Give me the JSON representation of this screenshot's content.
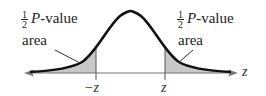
{
  "diagram": {
    "type": "normal-distribution-two-tailed",
    "left_label": {
      "fraction_num": "1",
      "fraction_den": "2",
      "var": "P",
      "text": "-value",
      "line2": "area"
    },
    "right_label": {
      "fraction_num": "1",
      "fraction_den": "2",
      "var": "P",
      "text": "-value",
      "line2": "area"
    },
    "axis_label": "z",
    "tick_left": "−z",
    "tick_right": "z",
    "colors": {
      "curve": "#111111",
      "shade": "#c8c8c8",
      "axis": "#777777",
      "text": "#222222"
    }
  }
}
